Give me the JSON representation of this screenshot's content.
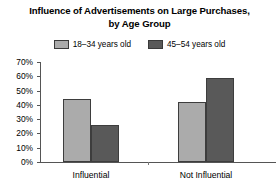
{
  "chart_data": {
    "type": "bar",
    "title": "Influence of Advertisements on Large Purchases, by Age Group",
    "title_line1": "Influence of Advertisements on Large Purchases,",
    "title_line2": "by Age Group",
    "xlabel": "",
    "ylabel": "",
    "categories": [
      "Influential",
      "Not Influential"
    ],
    "series": [
      {
        "name": "18–34 years old",
        "color": "#ababab",
        "values": [
          44,
          42
        ]
      },
      {
        "name": "45–54 years old",
        "color": "#595959",
        "values": [
          26,
          59
        ]
      }
    ],
    "ylim": [
      0,
      70
    ],
    "ytick_values": [
      70,
      60,
      50,
      40,
      30,
      20,
      10,
      0
    ],
    "ytick_labels": [
      "70%",
      "60%",
      "50%",
      "40%",
      "30%",
      "20%",
      "10%",
      "0%"
    ],
    "grid": false,
    "legend_position": "top-center",
    "axis_color": "#555555",
    "bar_border_color": "#3d3d3d",
    "background": "#ffffff"
  }
}
